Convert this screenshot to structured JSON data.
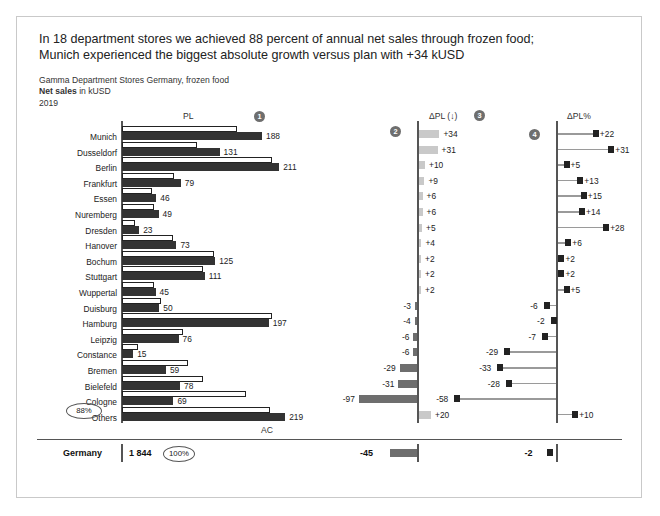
{
  "headline": {
    "line1": "In 18 department stores we achieved 88 percent of annual net sales through frozen food;",
    "line2": "Munich experienced the biggest absolute growth versus plan with +34 kUSD"
  },
  "subtitle": {
    "line1": "Gamma Department Stores Germany, frozen food",
    "measure": "Net sales",
    "unit": " in kUSD",
    "year": "2019"
  },
  "columns": {
    "pl": "PL",
    "ac": "AC",
    "dpl": "ΔPL (↓)",
    "dplpct": "ΔPL%"
  },
  "markers": {
    "m1": "1",
    "m2": "2",
    "m3": "3",
    "m4": "4"
  },
  "annotations": {
    "share": "88%",
    "total_share": "100%"
  },
  "total": {
    "label": "Germany",
    "ac": "1 844",
    "dpl": "-45",
    "dplpct": "-2"
  },
  "chart_data": {
    "type": "bar",
    "xlabel": "",
    "ylabel": "",
    "categories": [
      "Munich",
      "Dusseldorf",
      "Berlin",
      "Frankfurt",
      "Essen",
      "Nuremberg",
      "Dresden",
      "Hanover",
      "Bochum",
      "Stuttgart",
      "Wuppertal",
      "Duisburg",
      "Hamburg",
      "Leipzig",
      "Constance",
      "Bremen",
      "Bielefeld",
      "Cologne",
      "Others"
    ],
    "series": [
      {
        "name": "AC",
        "label": "Actual net sales (kUSD)",
        "values": [
          188,
          131,
          211,
          79,
          46,
          49,
          23,
          73,
          125,
          111,
          45,
          50,
          197,
          76,
          15,
          59,
          78,
          69,
          219
        ]
      },
      {
        "name": "PL",
        "label": "Plan net sales (kUSD)",
        "values": [
          154,
          100,
          201,
          70,
          40,
          43,
          18,
          69,
          123,
          109,
          43,
          53,
          201,
          82,
          21,
          88,
          109,
          166,
          199
        ]
      },
      {
        "name": "ΔPL",
        "label": "Absolute deviation vs plan (kUSD)",
        "values": [
          34,
          31,
          10,
          9,
          6,
          6,
          5,
          4,
          2,
          2,
          2,
          -3,
          -4,
          -6,
          -6,
          -29,
          -31,
          -97,
          20
        ]
      },
      {
        "name": "ΔPL%",
        "label": "Relative deviation vs plan (percent)",
        "values": [
          22,
          31,
          5,
          13,
          15,
          14,
          28,
          6,
          2,
          2,
          5,
          -6,
          -2,
          -7,
          -29,
          -33,
          -28,
          -58,
          10
        ]
      }
    ],
    "ac_labels": [
      "188",
      "131",
      "211",
      "79",
      "46",
      "49",
      "23",
      "73",
      "125",
      "111",
      "45",
      "50",
      "197",
      "76",
      "15",
      "59",
      "78",
      "69",
      "219"
    ],
    "dpl_labels": [
      "+34",
      "+31",
      "+10",
      "+9",
      "+6",
      "+6",
      "+5",
      "+4",
      "+2",
      "+2",
      "+2",
      "-3",
      "-4",
      "-6",
      "-6",
      "-29",
      "-31",
      "-97",
      "+20"
    ],
    "dplpct_labels": [
      "+22",
      "+31",
      "+5",
      "+13",
      "+15",
      "+14",
      "+28",
      "+6",
      "+2",
      "+2",
      "+5",
      "-6",
      "-2",
      "-7",
      "-29",
      "-33",
      "-28",
      "-58",
      "+10"
    ],
    "total_row": {
      "category": "Germany",
      "ac": 1844,
      "dpl": -45,
      "dplpct": -2,
      "share_pct": 100
    },
    "grid": false,
    "legend": "none"
  }
}
